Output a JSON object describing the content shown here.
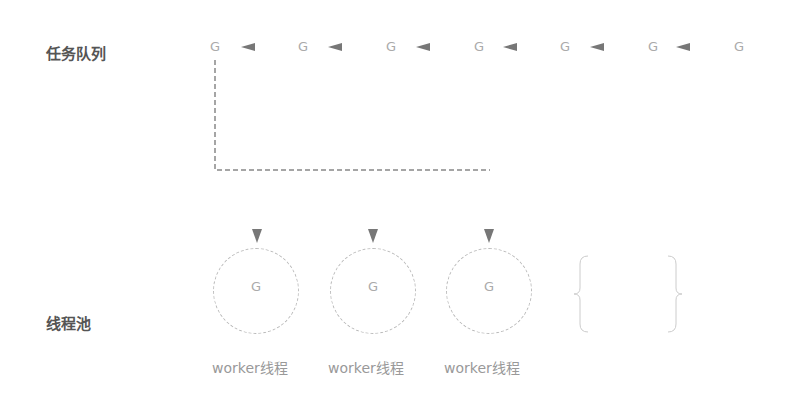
{
  "queue": {
    "label": "任务队列",
    "items": [
      "G",
      "G",
      "G",
      "G",
      "G",
      "G",
      "G"
    ],
    "arrow_icon": "left-arrow-icon"
  },
  "pool": {
    "label": "线程池",
    "workers": [
      {
        "task": "G",
        "label": "worker线程"
      },
      {
        "task": "G",
        "label": "worker线程"
      },
      {
        "task": "G",
        "label": "worker线程"
      }
    ],
    "more_placeholder": "ellipsis-brace-group"
  },
  "colors": {
    "label": "#555555",
    "line": "#888888",
    "arrow": "#777777",
    "faint": "#bbbbbb"
  }
}
